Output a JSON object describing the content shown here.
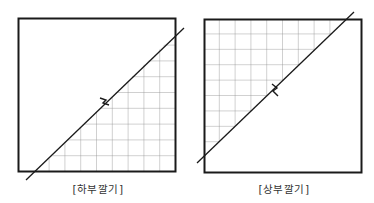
{
  "diagrams": [
    {
      "id": "lower",
      "caption": "[하부깔기]",
      "grid_side": "below-diagonal"
    },
    {
      "id": "upper",
      "caption": "[상부깔기]",
      "grid_side": "above-diagonal"
    }
  ],
  "colors": {
    "frame": "#1a1a1a",
    "grid": "#8a8a8a",
    "diagonal": "#1a1a1a",
    "caption": "#333333"
  }
}
